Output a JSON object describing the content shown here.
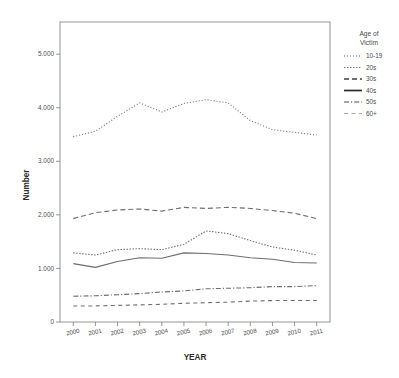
{
  "chart_data": {
    "type": "line",
    "title": "",
    "xlabel": "YEAR",
    "ylabel": "Number",
    "x": [
      2000,
      2001,
      2002,
      2003,
      2004,
      2005,
      2006,
      2007,
      2008,
      2009,
      2010,
      2011
    ],
    "xtick_labels": [
      "2000",
      "2001",
      "2002",
      "2003",
      "2004",
      "2005",
      "2006",
      "2007",
      "2008",
      "2009",
      "2010",
      "2011"
    ],
    "ytick_labels": [
      "0",
      "1.000",
      "2.000",
      "3.000",
      "4.000",
      "5.000"
    ],
    "ytick_values": [
      0,
      1000,
      2000,
      3000,
      4000,
      5000
    ],
    "ylim": [
      0,
      5600
    ],
    "xlim": [
      1999.4,
      2011.6
    ],
    "grid": false,
    "legend_position": "right",
    "legend_title": "Age of\nVictim",
    "legend_title_line1": "Age of",
    "legend_title_line2": "Victim",
    "series": [
      {
        "name": "10-19",
        "dash": "1,2",
        "width": 1.15,
        "color": "#777777",
        "values": [
          3460,
          3560,
          3840,
          4090,
          3920,
          4080,
          4150,
          4090,
          3760,
          3590,
          3540,
          3490
        ]
      },
      {
        "name": "20s",
        "dash": "1.4,1.6",
        "width": 1.15,
        "color": "#6b6b6b",
        "values": [
          1290,
          1250,
          1350,
          1370,
          1350,
          1450,
          1700,
          1650,
          1520,
          1400,
          1340,
          1250
        ]
      },
      {
        "name": "30s",
        "dash": "5,3",
        "width": 1.35,
        "color": "#3f3f3f",
        "values": [
          1930,
          2040,
          2090,
          2110,
          2070,
          2140,
          2120,
          2140,
          2120,
          2080,
          2030,
          1930
        ]
      },
      {
        "name": "40s",
        "dash": "none",
        "width": 1.7,
        "color": "#2a2a2a",
        "values": [
          1090,
          1020,
          1130,
          1200,
          1190,
          1290,
          1280,
          1250,
          1200,
          1170,
          1110,
          1100
        ]
      },
      {
        "name": "50s",
        "dash": "5,2,1.2,2",
        "width": 1.2,
        "color": "#4a4a4a",
        "values": [
          480,
          490,
          510,
          530,
          560,
          580,
          620,
          630,
          640,
          660,
          660,
          680
        ]
      },
      {
        "name": "60+",
        "dash": "4,3.5",
        "width": 1.0,
        "color": "#a8a8a8",
        "values": [
          300,
          300,
          310,
          320,
          330,
          350,
          360,
          370,
          390,
          400,
          400,
          400
        ]
      }
    ]
  }
}
